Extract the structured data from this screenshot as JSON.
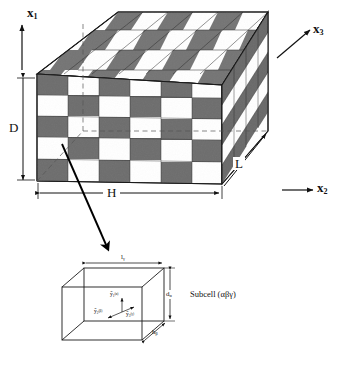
{
  "figure": {
    "type": "technical-diagram"
  },
  "colors": {
    "dark_cell": "#6e6e6e",
    "light_cell": "#ffffff",
    "top_dark_cell": "#757575",
    "side_dark_cell": "#6a6a6a",
    "line": "#1a1a1a",
    "background": "#ffffff",
    "leader": "#000000"
  },
  "global_axes": [
    {
      "name": "x1",
      "label": "x",
      "subscript": "1",
      "direction": "up",
      "data_name": "axis-x1"
    },
    {
      "name": "x2",
      "label": "x",
      "subscript": "2",
      "direction": "right",
      "data_name": "axis-x2"
    },
    {
      "name": "x3",
      "label": "x",
      "subscript": "3",
      "direction": "up-right",
      "data_name": "axis-x3"
    }
  ],
  "block_dimensions": [
    {
      "name": "D",
      "label": "D",
      "description": "height of the unit cell along x1",
      "data_name": "dimension-D"
    },
    {
      "name": "H",
      "label": "H",
      "description": "width of the unit cell along x2",
      "data_name": "dimension-H"
    },
    {
      "name": "L",
      "label": "L",
      "description": "depth of the unit cell along x3",
      "data_name": "dimension-L"
    }
  ],
  "subcell": {
    "caption": "Subcell (αβγ)",
    "dimensions": [
      {
        "name": "l_gamma",
        "label": "l",
        "subscript": "γ",
        "edge": "width",
        "data_name": "subcell-dimension-l-gamma"
      },
      {
        "name": "d_alpha",
        "label": "d",
        "subscript": "α",
        "edge": "height",
        "data_name": "subcell-dimension-d-alpha"
      },
      {
        "name": "h_beta",
        "label": "h",
        "subscript": "β",
        "edge": "depth",
        "data_name": "subcell-dimension-h-beta"
      }
    ],
    "local_axes": [
      {
        "name": "y1_alpha",
        "label": "ȳ",
        "subscript": "1",
        "superscript": "(α)",
        "direction": "up",
        "data_name": "subcell-axis-y1-alpha"
      },
      {
        "name": "y2_beta",
        "label": "ȳ",
        "subscript": "2",
        "superscript": "(β)",
        "direction": "left",
        "data_name": "subcell-axis-y2-beta"
      },
      {
        "name": "y3_gamma",
        "label": "ȳ",
        "subscript": "3",
        "superscript": "(γ)",
        "direction": "right",
        "data_name": "subcell-axis-y3-gamma"
      }
    ]
  },
  "checkerboard": {
    "front_face": {
      "columns": 6,
      "rows": 5,
      "pattern": "alternating"
    },
    "top_face": {
      "columns": 6,
      "rows": 4,
      "pattern": "alternating"
    },
    "right_face": {
      "columns": 4,
      "rows": 5,
      "pattern": "alternating"
    }
  },
  "leader": {
    "description": "arrow from a front-face subcell down to the magnified subcell",
    "data_name": "leader-arrow"
  }
}
